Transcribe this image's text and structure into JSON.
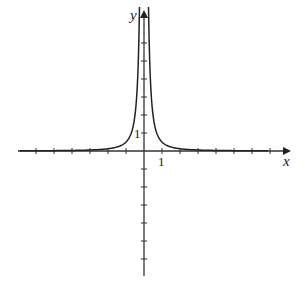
{
  "chart_data": {
    "type": "line",
    "title": "",
    "xlabel": "x",
    "ylabel": "y",
    "x_tick_label": "1",
    "y_tick_label": "1",
    "xlim": [
      -7,
      8
    ],
    "ylim": [
      -7,
      7
    ],
    "x_ticks": [
      -6,
      -5,
      -4,
      -3,
      -2,
      -1,
      1,
      2,
      3,
      4,
      5,
      6,
      7
    ],
    "y_ticks": [
      -6,
      -5,
      -4,
      -3,
      -2,
      -1,
      1,
      2,
      3,
      4,
      5,
      6
    ],
    "grid": false,
    "series": [
      {
        "name": "y = 1/(2x^2)",
        "x": [
          -7,
          -4,
          -2,
          -1,
          -0.5,
          -0.25,
          0.25,
          0.5,
          1,
          2,
          4,
          7
        ],
        "values": [
          0.01,
          0.03,
          0.125,
          0.5,
          2,
          8,
          8,
          2,
          0.5,
          0.125,
          0.03,
          0.01
        ]
      }
    ]
  },
  "axes": {
    "x_label": "x",
    "y_label": "y",
    "one_x": "1",
    "one_y": "1"
  }
}
